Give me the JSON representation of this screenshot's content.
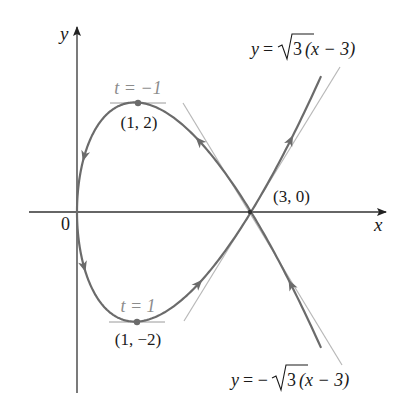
{
  "chart_data": {
    "type": "line",
    "title": "",
    "xlabel": "x",
    "ylabel": "y",
    "origin_label": "0",
    "curve": {
      "x_of_t": "t^2",
      "y_of_t": "t^3 - 3t",
      "t_range": [
        -2.05,
        2.05
      ]
    },
    "points": [
      {
        "x": 1,
        "y": 2,
        "label": "(1, 2)",
        "param_label": "t = −1"
      },
      {
        "x": 1,
        "y": -2,
        "label": "(1, −2)",
        "param_label": "t = 1"
      },
      {
        "x": 3,
        "y": 0,
        "label": "(3, 0)"
      }
    ],
    "tangent_lines": [
      {
        "equation": "y = √3 (x − 3)",
        "slope": 1.732,
        "through": [
          3,
          0
        ]
      },
      {
        "equation": "y = −√3 (x − 3)",
        "slope": -1.732,
        "through": [
          3,
          0
        ]
      }
    ],
    "grid": false,
    "legend": "none"
  },
  "labels": {
    "y_axis": "y",
    "x_axis": "x",
    "origin": "0",
    "t_top": "t = −1",
    "pt_top": "(1, 2)",
    "t_bottom": "t = 1",
    "pt_bottom": "(1, −2)",
    "pt_cross": "(3, 0)",
    "eq_top_y": "y",
    "eq_top_eq": "=",
    "eq_top_root": "3",
    "eq_top_tail": "(x − 3)",
    "eq_bot_y": "y",
    "eq_bot_eq": "= −",
    "eq_bot_root": "3",
    "eq_bot_tail": "(x − 3)"
  },
  "colors": {
    "curve": "#6b6b6b",
    "tangent": "#b5b5b5",
    "axis": "#333333",
    "param_label": "#8c8c8c"
  }
}
